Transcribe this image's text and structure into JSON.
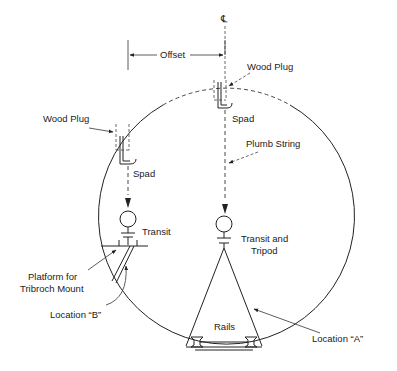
{
  "diagram": {
    "centerline_symbol": "℄",
    "labels": {
      "offset": "Offset",
      "wood_plug_top": "Wood Plug",
      "wood_plug_left": "Wood Plug",
      "spad_top": "Spad",
      "spad_left": "Spad",
      "plumb_string": "Plumb String",
      "transit_left": "Transit",
      "transit_and_tripod_line1": "Transit and",
      "transit_and_tripod_line2": "Tripod",
      "platform_line1": "Platform for",
      "platform_line2": "Tribroch Mount",
      "location_b": "Location “B”",
      "rails": "Rails",
      "location_a": "Location “A”"
    },
    "colors": {
      "line": "#222222",
      "background": "#ffffff"
    }
  }
}
